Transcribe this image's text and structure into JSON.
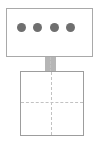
{
  "diagram": {
    "type": "schematic-icon",
    "background_color": "#ffffff",
    "top_panel": {
      "name": "display-panel",
      "label": "",
      "x": 6,
      "y": 8,
      "width": 87,
      "height": 49,
      "border_color": "#a9a9a9",
      "fill_color": "#ffffff",
      "border_width": 1
    },
    "indicators": {
      "name": "indicator-dots",
      "count": 4,
      "color": "#6f6f6f",
      "diameter": 9,
      "items": [
        {
          "label": "",
          "cx": 20,
          "cy": 26
        },
        {
          "label": "",
          "cx": 36,
          "cy": 26
        },
        {
          "label": "",
          "cx": 53,
          "cy": 26
        },
        {
          "label": "",
          "cx": 69,
          "cy": 26
        }
      ]
    },
    "connector": {
      "name": "stand-neck",
      "label": "",
      "x": 45,
      "y": 57,
      "width": 11,
      "height": 15,
      "fill_color": "#b6b6b6"
    },
    "base": {
      "name": "base-plate",
      "label": "",
      "x": 20,
      "y": 71,
      "width": 64,
      "height": 65,
      "border_color": "#9d9d9d",
      "fill_color": "#ffffff",
      "border_width": 1
    },
    "guides": {
      "name": "center-crosshair",
      "style": "dashed",
      "color": "#c2c2c2",
      "horizontal_y": 102,
      "vertical_x": 51
    }
  }
}
